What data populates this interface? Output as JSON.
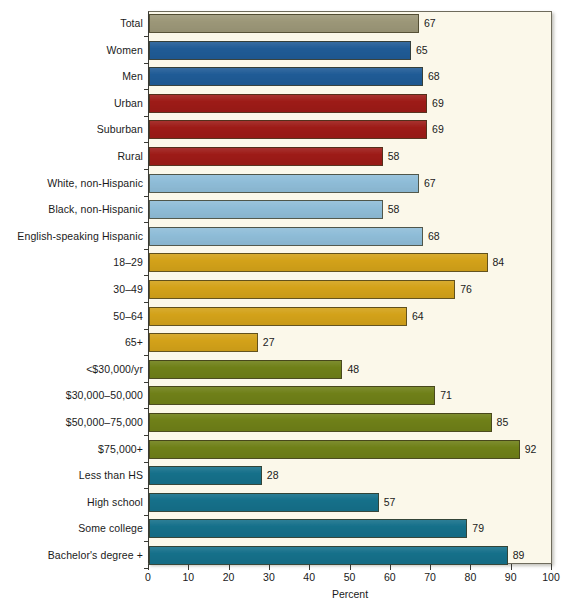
{
  "chart_data": {
    "type": "bar",
    "orientation": "horizontal",
    "title": "",
    "xlabel": "Percent",
    "ylabel": "",
    "xlim": [
      0,
      100
    ],
    "xticks": [
      0,
      10,
      20,
      30,
      40,
      50,
      60,
      70,
      80,
      90,
      100
    ],
    "grid": false,
    "legend": "none",
    "categories": [
      "Total",
      "Women",
      "Men",
      "Urban",
      "Suburban",
      "Rural",
      "White, non-Hispanic",
      "Black, non-Hispanic",
      "English-speaking Hispanic",
      "18–29",
      "30–49",
      "50–64",
      "65+",
      "<$30,000/yr",
      "$30,000–50,000",
      "$50,000–75,000",
      "$75,000+",
      "Less than HS",
      "High school",
      "Some college",
      "Bachelor's degree +"
    ],
    "values": [
      67,
      65,
      68,
      69,
      69,
      58,
      67,
      58,
      68,
      84,
      76,
      64,
      27,
      48,
      71,
      85,
      92,
      28,
      57,
      79,
      89
    ],
    "value_labels": [
      "67",
      "65",
      "68",
      "69",
      "69",
      "58",
      "67",
      "58",
      "68",
      "84",
      "76",
      "64",
      "27",
      "48",
      "71",
      "85",
      "92",
      "28",
      "57",
      "79",
      "89"
    ],
    "group_colors": {
      "total": "#9c9778",
      "gender": "#1f5b96",
      "community": "#9d1b17",
      "race": "#8fbdd8",
      "age": "#d3a219",
      "income": "#6f8018",
      "education": "#15708a"
    },
    "bar_colors": [
      "#9c9778",
      "#1f5b96",
      "#1f5b96",
      "#9d1b17",
      "#9d1b17",
      "#9d1b17",
      "#8fbdd8",
      "#8fbdd8",
      "#8fbdd8",
      "#d3a219",
      "#d3a219",
      "#d3a219",
      "#d3a219",
      "#6f8018",
      "#6f8018",
      "#6f8018",
      "#6f8018",
      "#15708a",
      "#15708a",
      "#15708a",
      "#15708a"
    ]
  },
  "figure": {
    "background_color": "#ffffff",
    "panel_color": "#fbf8ea",
    "axis_color": "#3a3a34"
  }
}
